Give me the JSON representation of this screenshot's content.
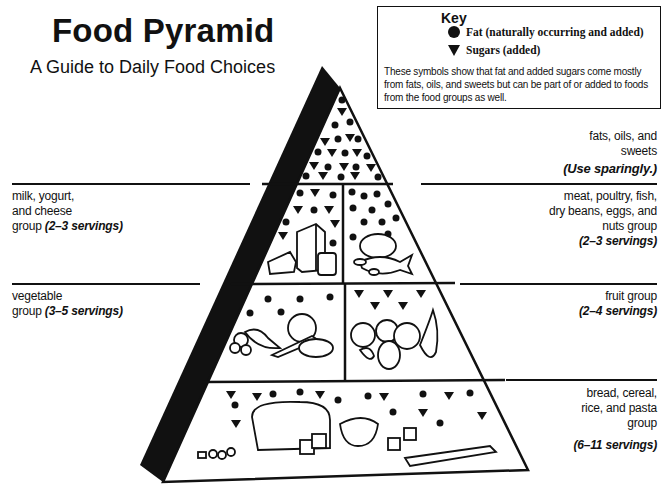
{
  "header": {
    "title": "Food Pyramid",
    "subtitle": "A Guide to Daily Food Choices"
  },
  "key": {
    "title": "Key",
    "items": [
      {
        "icon": "circle-icon",
        "label": "Fat (naturally occurring and added)"
      },
      {
        "icon": "triangle-down-icon",
        "label": "Sugars (added)"
      }
    ],
    "description": "These symbols show that fat and added sugars come mostly from fats, oils, and sweets but can be part of or added to foods from the food groups as well."
  },
  "groups": {
    "fats": {
      "name_line1": "fats, oils, and",
      "name_line2": "sweets",
      "servings": "(Use sparingly.)"
    },
    "milk": {
      "name_line1": "milk, yogurt,",
      "name_line2": "and cheese",
      "name_line3": "group",
      "servings": "(2–3 servings)"
    },
    "meat": {
      "name_line1": "meat, poultry, fish,",
      "name_line2": "dry beans, eggs, and",
      "name_line3": "nuts group",
      "servings": "(2–3 servings)"
    },
    "vegetable": {
      "name_line1": "vegetable",
      "name_line2": "group",
      "servings": "(3–5 servings)"
    },
    "fruit": {
      "name_line1": "fruit group",
      "servings": "(2–4 servings)"
    },
    "bread": {
      "name_line1": "bread, cereal,",
      "name_line2": "rice, and pasta",
      "name_line3": "group",
      "servings": "(6–11 servings)"
    }
  },
  "colors": {
    "ink": "#111111",
    "background": "#ffffff"
  }
}
